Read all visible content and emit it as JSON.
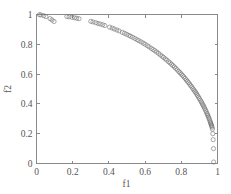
{
  "figure": {
    "background_color": "#ffffff",
    "axis_color": "#8a8a8a",
    "marker_color": "#6f6f6f",
    "text_color": "#555555"
  },
  "chart_data": {
    "type": "scatter",
    "title": "",
    "xlabel": "f1",
    "ylabel": "f2",
    "xlim": [
      0,
      1
    ],
    "ylim": [
      0,
      1
    ],
    "xticks": [
      "0",
      "0.2",
      "0.4",
      "0.6",
      "0.8",
      "1"
    ],
    "yticks": [
      "0",
      "0.2",
      "0.4",
      "0.6",
      "0.8",
      "1"
    ],
    "xtick_values": [
      0,
      0.2,
      0.4,
      0.6,
      0.8,
      1
    ],
    "ytick_values": [
      0,
      0.2,
      0.4,
      0.6,
      0.8,
      1
    ],
    "grid": false,
    "legend": null,
    "marker": "o",
    "marker_size": 2.1,
    "series": [
      {
        "name": "pareto-front",
        "x": [
          0.016,
          0.024,
          0.04,
          0.052,
          0.075,
          0.086,
          0.097,
          0.168,
          0.18,
          0.196,
          0.21,
          0.222,
          0.235,
          0.3,
          0.312,
          0.327,
          0.34,
          0.352,
          0.366,
          0.378,
          0.404,
          0.418,
          0.43,
          0.444,
          0.456,
          0.474,
          0.486,
          0.498,
          0.51,
          0.52,
          0.532,
          0.544,
          0.556,
          0.566,
          0.578,
          0.59,
          0.6,
          0.612,
          0.622,
          0.634,
          0.644,
          0.654,
          0.664,
          0.674,
          0.684,
          0.694,
          0.702,
          0.712,
          0.72,
          0.73,
          0.738,
          0.746,
          0.754,
          0.762,
          0.77,
          0.778,
          0.786,
          0.793,
          0.8,
          0.807,
          0.814,
          0.821,
          0.828,
          0.834,
          0.84,
          0.846,
          0.852,
          0.858,
          0.864,
          0.87,
          0.875,
          0.88,
          0.885,
          0.89,
          0.895,
          0.9,
          0.905,
          0.91,
          0.914,
          0.918,
          0.922,
          0.926,
          0.93,
          0.934,
          0.938,
          0.942,
          0.945,
          0.948,
          0.951,
          0.954,
          0.957,
          0.96,
          0.962,
          0.964,
          0.966,
          0.968,
          0.97,
          0.972,
          0.974,
          0.976,
          0.978,
          0.979
        ],
        "y": [
          0.999,
          0.997,
          0.992,
          0.986,
          0.972,
          0.963,
          0.953,
          0.986,
          0.984,
          0.981,
          0.978,
          0.975,
          0.972,
          0.954,
          0.95,
          0.945,
          0.94,
          0.936,
          0.931,
          0.926,
          0.915,
          0.909,
          0.903,
          0.896,
          0.89,
          0.88,
          0.874,
          0.867,
          0.86,
          0.854,
          0.847,
          0.839,
          0.831,
          0.824,
          0.816,
          0.808,
          0.8,
          0.791,
          0.783,
          0.773,
          0.765,
          0.757,
          0.748,
          0.739,
          0.729,
          0.72,
          0.712,
          0.702,
          0.694,
          0.683,
          0.675,
          0.666,
          0.657,
          0.648,
          0.638,
          0.628,
          0.618,
          0.609,
          0.6,
          0.591,
          0.581,
          0.571,
          0.561,
          0.552,
          0.543,
          0.533,
          0.523,
          0.514,
          0.503,
          0.493,
          0.484,
          0.475,
          0.466,
          0.456,
          0.446,
          0.436,
          0.425,
          0.415,
          0.406,
          0.396,
          0.387,
          0.378,
          0.368,
          0.357,
          0.347,
          0.336,
          0.327,
          0.319,
          0.309,
          0.3,
          0.29,
          0.28,
          0.272,
          0.265,
          0.258,
          0.251,
          0.243,
          0.23,
          0.2,
          0.16,
          0.1,
          0.01
        ]
      }
    ]
  }
}
